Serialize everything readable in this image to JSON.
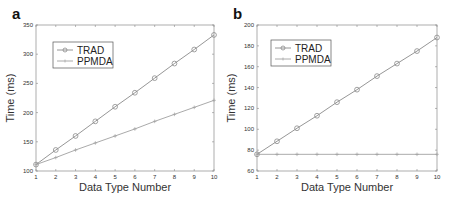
{
  "chart_data": [
    {
      "panel": "a",
      "type": "line",
      "title": "",
      "xlabel": "Data Type Number",
      "ylabel": "Time (ms)",
      "x": [
        1,
        2,
        3,
        4,
        5,
        6,
        7,
        8,
        9,
        10
      ],
      "xlim": [
        1,
        10
      ],
      "ylim": [
        100,
        350
      ],
      "xticks": [
        1,
        2,
        3,
        4,
        5,
        6,
        7,
        8,
        9,
        10
      ],
      "yticks": [
        100,
        150,
        200,
        250,
        300,
        350
      ],
      "grid": false,
      "legend_position": "upper left",
      "series": [
        {
          "name": "TRAD",
          "marker": "circle",
          "color": "#8a8a8a",
          "values": [
            111,
            136,
            160,
            185,
            210,
            234,
            259,
            284,
            308,
            333
          ]
        },
        {
          "name": "PPMDA",
          "marker": "plus",
          "color": "#a0a0a0",
          "values": [
            111,
            123,
            136,
            148,
            160,
            172,
            185,
            197,
            209,
            221
          ]
        }
      ]
    },
    {
      "panel": "b",
      "type": "line",
      "title": "",
      "xlabel": "Data Type Number",
      "ylabel": "Time (ms)",
      "x": [
        1,
        2,
        3,
        4,
        5,
        6,
        7,
        8,
        9,
        10
      ],
      "xlim": [
        1,
        10
      ],
      "ylim": [
        60,
        200
      ],
      "xticks": [
        1,
        2,
        3,
        4,
        5,
        6,
        7,
        8,
        9,
        10
      ],
      "yticks": [
        60,
        80,
        100,
        120,
        140,
        160,
        180,
        200
      ],
      "grid": false,
      "legend_position": "upper left",
      "series": [
        {
          "name": "TRAD",
          "marker": "circle",
          "color": "#8a8a8a",
          "values": [
            76,
            88.5,
            101,
            113,
            126,
            138,
            151,
            163,
            175,
            188
          ]
        },
        {
          "name": "PPMDA",
          "marker": "plus",
          "color": "#a0a0a0",
          "values": [
            76,
            76,
            76,
            76,
            76,
            76,
            76,
            76,
            76,
            76
          ]
        }
      ]
    }
  ],
  "panels": [
    {
      "label": "a",
      "frame": {
        "left": 36,
        "top": 25,
        "right": 214,
        "bottom": 171
      }
    },
    {
      "label": "b",
      "frame": {
        "left": 257,
        "top": 25,
        "right": 437,
        "bottom": 171
      }
    }
  ]
}
